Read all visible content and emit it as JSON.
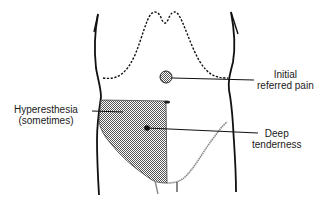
{
  "diagram": {
    "colors": {
      "ink": "#111111",
      "shading": "#8a8a8a",
      "background": "#ffffff"
    },
    "labels": {
      "initial_referred_pain": {
        "line1": "Initial",
        "line2": "referred pain"
      },
      "deep_tenderness": {
        "line1": "Deep",
        "line2": "tenderness"
      },
      "hyperesthesia": {
        "line1": "Hyperesthesia",
        "line2": "(sometimes)"
      }
    },
    "markers": [
      {
        "name": "initial-referred-pain-dot",
        "x": 166,
        "y": 77
      },
      {
        "name": "deep-tenderness-dot",
        "x": 147,
        "y": 128
      },
      {
        "name": "umbilicus",
        "x": 167,
        "y": 102
      }
    ]
  }
}
